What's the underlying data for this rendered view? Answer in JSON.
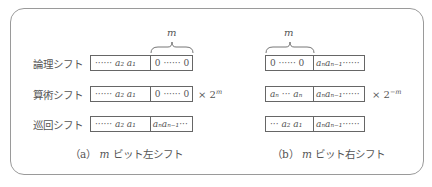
{
  "rows": [
    {
      "label": "論理シフト"
    },
    {
      "label": "算術シフト"
    },
    {
      "label": "巡回シフト"
    }
  ],
  "left": {
    "brace_label": "m",
    "boxes": [
      {
        "a": "······ a₂ a₁",
        "b": "0 ······ 0"
      },
      {
        "a": "······ a₂ a₁",
        "b": "0 ······ 0"
      },
      {
        "a": "······ a₂ a₁",
        "b": "aₙaₙ₋₁···"
      }
    ],
    "multiplier_base": "× 2",
    "multiplier_exp": "m",
    "caption_prefix": "（a）",
    "caption_var": "m",
    "caption_text": " ビット左シフト"
  },
  "right": {
    "brace_label": "m",
    "boxes": [
      {
        "a": "0 ······ 0",
        "b": "aₙaₙ₋₁······"
      },
      {
        "a": "aₙ ··· aₙ",
        "b": "aₙaₙ₋₁······"
      },
      {
        "a": "··· a₂ a₁",
        "b": "aₙaₙ₋₁······"
      }
    ],
    "multiplier_base": "× 2",
    "multiplier_exp": "−m",
    "caption_prefix": "（b）",
    "caption_var": "m",
    "caption_text": " ビット右シフト"
  }
}
